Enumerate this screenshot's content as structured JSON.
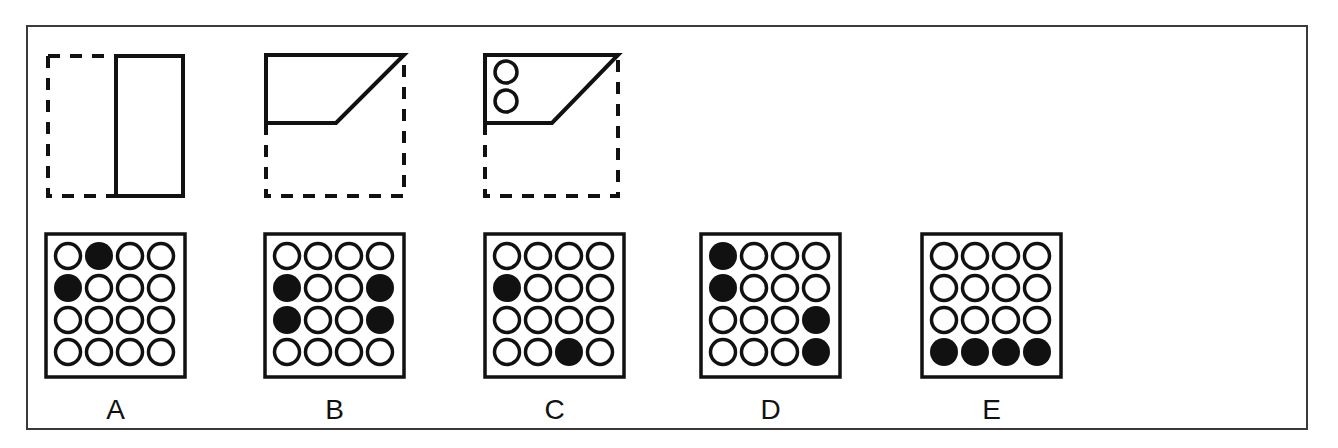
{
  "question": {
    "prompt_figures": [
      {
        "id": "fig1",
        "description": "square folded: left half dashed, right half solid rectangle"
      },
      {
        "id": "fig2",
        "description": "square folded: bottom-right diagonal fold to top-left, dashed remainder"
      },
      {
        "id": "fig3",
        "description": "folded shape with two punched holes at left"
      }
    ],
    "holes_in_fig3": 2
  },
  "options": [
    {
      "label": "A",
      "grid": [
        [
          0,
          1,
          0,
          0
        ],
        [
          1,
          0,
          0,
          0
        ],
        [
          0,
          0,
          0,
          0
        ],
        [
          0,
          0,
          0,
          0
        ]
      ]
    },
    {
      "label": "B",
      "grid": [
        [
          0,
          0,
          0,
          0
        ],
        [
          1,
          0,
          0,
          1
        ],
        [
          1,
          0,
          0,
          1
        ],
        [
          0,
          0,
          0,
          0
        ]
      ]
    },
    {
      "label": "C",
      "grid": [
        [
          0,
          0,
          0,
          0
        ],
        [
          1,
          0,
          0,
          0
        ],
        [
          0,
          0,
          0,
          0
        ],
        [
          0,
          0,
          1,
          0
        ]
      ]
    },
    {
      "label": "D",
      "grid": [
        [
          1,
          0,
          0,
          0
        ],
        [
          1,
          0,
          0,
          0
        ],
        [
          0,
          0,
          0,
          1
        ],
        [
          0,
          0,
          0,
          1
        ]
      ]
    },
    {
      "label": "E",
      "grid": [
        [
          0,
          0,
          0,
          0
        ],
        [
          0,
          0,
          0,
          0
        ],
        [
          0,
          0,
          0,
          0
        ],
        [
          1,
          1,
          1,
          1
        ]
      ]
    }
  ],
  "colors": {
    "ink": "#111111",
    "frame": "#3a3a3a",
    "background": "#ffffff"
  }
}
